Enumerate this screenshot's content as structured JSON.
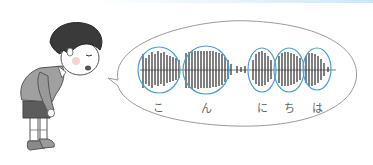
{
  "illustration": {
    "subject": "bowing boy speaking",
    "speech_bubble": {
      "content": "audio waveform",
      "syllables": [
        {
          "label": "こ",
          "x": 158
        },
        {
          "label": "ん",
          "x": 206
        },
        {
          "label": "に",
          "x": 262
        },
        {
          "label": "ち",
          "x": 289
        },
        {
          "label": "は",
          "x": 317
        }
      ]
    },
    "colors": {
      "circle": "#4a9fd0",
      "outline": "#888888",
      "waveform": "#2a2a2a",
      "hair": "#3a3a3a",
      "shirt": "#9a9a9a",
      "shorts": "#5a5a5a"
    }
  }
}
